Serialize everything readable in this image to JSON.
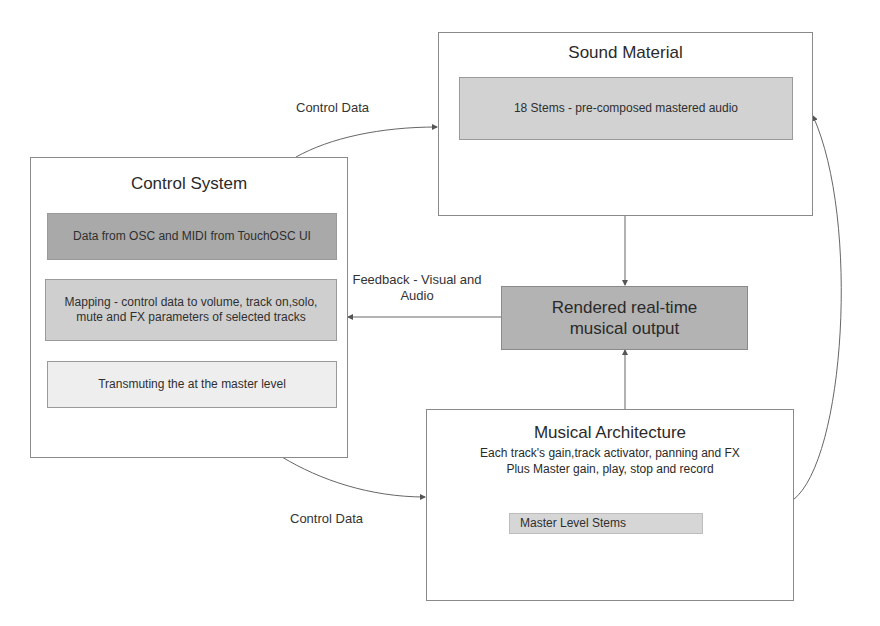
{
  "diagram": {
    "nodes": {
      "sound_material": {
        "title": "Sound Material",
        "items": [
          "18 Stems - pre-composed mastered audio"
        ]
      },
      "control_system": {
        "title": "Control System",
        "items": [
          "Data from OSC and MIDI from TouchOSC UI",
          "Mapping - control data to volume, track on,solo, mute and FX parameters of selected tracks",
          "Transmuting the at the master level"
        ]
      },
      "rendered_output": {
        "title": "Rendered real-time musical output"
      },
      "musical_architecture": {
        "title": "Musical Architecture",
        "description_line1": "Each track's gain,track activator, panning and FX",
        "description_line2": "Plus Master gain, play, stop and record",
        "items": [
          "Master Level Stems"
        ]
      }
    },
    "edges": [
      {
        "from": "control_system",
        "to": "sound_material",
        "label": "Control Data"
      },
      {
        "from": "rendered_output",
        "to": "control_system",
        "label": "Feedback - Visual and Audio"
      },
      {
        "from": "control_system",
        "to": "musical_architecture",
        "label": "Control Data"
      },
      {
        "from": "sound_material",
        "to": "rendered_output",
        "label": ""
      },
      {
        "from": "musical_architecture",
        "to": "rendered_output",
        "label": ""
      },
      {
        "from": "musical_architecture",
        "to": "sound_material",
        "label": ""
      }
    ],
    "colors": {
      "dark_fill": "#a9a9a9",
      "medium_fill": "#cfcfcf",
      "light_fill": "#ececec",
      "stems_fill": "#d6d6d6",
      "border": "#8a8a8a",
      "line": "#555555"
    }
  }
}
